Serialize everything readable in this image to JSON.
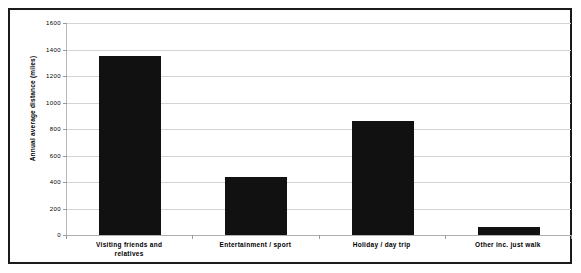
{
  "chart_data": {
    "type": "bar",
    "title": "",
    "xlabel": "",
    "ylabel": "Annual average distance (miles)",
    "categories": [
      "Visiting friends and relatives",
      "Entertainment / sport",
      "Holiday / day trip",
      "Other inc. just walk"
    ],
    "category_lines": [
      [
        "Visiting friends and",
        "relatives"
      ],
      [
        "Entertainment / sport"
      ],
      [
        "Holiday / day trip"
      ],
      [
        "Other inc. just walk"
      ]
    ],
    "values": [
      1350,
      440,
      860,
      60
    ],
    "ylim": [
      0,
      1600
    ],
    "ytick_step": 200,
    "yticks": [
      "0",
      "200",
      "400",
      "600",
      "800",
      "1000",
      "1200",
      "1400",
      "1600"
    ],
    "grid": true,
    "legend": "none",
    "bar_color": "#111111",
    "grid_color": "#d3d3d3",
    "frame_color": "#1a1a1a"
  }
}
